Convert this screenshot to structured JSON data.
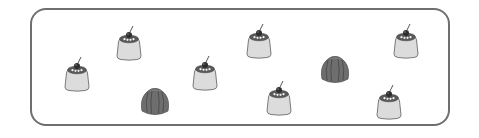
{
  "scene": {
    "description": "Counting worksheet box containing custard puddings and jelly molds",
    "frame_color": "#6f6f6f",
    "pudding_count": 7,
    "jelly_count": 2
  },
  "items": [
    {
      "type": "pudding",
      "left": 63,
      "top": 56
    },
    {
      "type": "pudding",
      "left": 115,
      "top": 25
    },
    {
      "type": "jelly",
      "left": 139,
      "top": 86
    },
    {
      "type": "pudding",
      "left": 191,
      "top": 55
    },
    {
      "type": "pudding",
      "left": 245,
      "top": 23
    },
    {
      "type": "pudding",
      "left": 265,
      "top": 80
    },
    {
      "type": "jelly",
      "left": 319,
      "top": 54
    },
    {
      "type": "pudding",
      "left": 392,
      "top": 23
    },
    {
      "type": "pudding",
      "left": 375,
      "top": 84
    }
  ],
  "colors": {
    "pudding_body": "#dcdcdc",
    "pudding_outline": "#7a7a7a",
    "caramel": "#5a5a5a",
    "cherry": "#2e2e2e",
    "jelly": "#6e6e6e",
    "jelly_ridge": "#4a4a4a"
  }
}
